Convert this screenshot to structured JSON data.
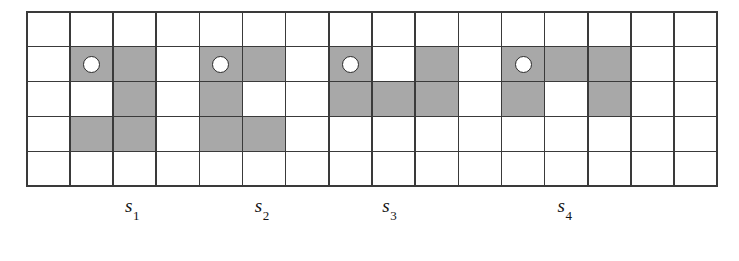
{
  "figure": {
    "grid": {
      "columns": 16,
      "rows": 5,
      "line_color": "#3a3a3a",
      "cell_fill_empty": "#ffffff",
      "cell_fill_shaded": "#a8a8a8",
      "marker_shape": "circle",
      "marker_fill": "#ffffff",
      "marker_stroke": "#2b2b2b"
    },
    "cells": [
      {
        "row": 1,
        "col": 1,
        "shaded": false,
        "marker": false
      },
      {
        "row": 1,
        "col": 2,
        "shaded": false,
        "marker": false
      },
      {
        "row": 1,
        "col": 3,
        "shaded": false,
        "marker": false
      },
      {
        "row": 1,
        "col": 4,
        "shaded": false,
        "marker": false
      },
      {
        "row": 1,
        "col": 5,
        "shaded": false,
        "marker": false
      },
      {
        "row": 1,
        "col": 6,
        "shaded": false,
        "marker": false
      },
      {
        "row": 1,
        "col": 7,
        "shaded": false,
        "marker": false
      },
      {
        "row": 1,
        "col": 8,
        "shaded": false,
        "marker": false
      },
      {
        "row": 1,
        "col": 9,
        "shaded": false,
        "marker": false
      },
      {
        "row": 1,
        "col": 10,
        "shaded": false,
        "marker": false
      },
      {
        "row": 1,
        "col": 11,
        "shaded": false,
        "marker": false
      },
      {
        "row": 1,
        "col": 12,
        "shaded": false,
        "marker": false
      },
      {
        "row": 1,
        "col": 13,
        "shaded": false,
        "marker": false
      },
      {
        "row": 1,
        "col": 14,
        "shaded": false,
        "marker": false
      },
      {
        "row": 1,
        "col": 15,
        "shaded": false,
        "marker": false
      },
      {
        "row": 1,
        "col": 16,
        "shaded": false,
        "marker": false
      },
      {
        "row": 2,
        "col": 1,
        "shaded": false,
        "marker": false
      },
      {
        "row": 2,
        "col": 2,
        "shaded": true,
        "marker": true
      },
      {
        "row": 2,
        "col": 3,
        "shaded": true,
        "marker": false
      },
      {
        "row": 2,
        "col": 4,
        "shaded": false,
        "marker": false
      },
      {
        "row": 2,
        "col": 5,
        "shaded": true,
        "marker": true
      },
      {
        "row": 2,
        "col": 6,
        "shaded": true,
        "marker": false
      },
      {
        "row": 2,
        "col": 7,
        "shaded": false,
        "marker": false
      },
      {
        "row": 2,
        "col": 8,
        "shaded": true,
        "marker": true
      },
      {
        "row": 2,
        "col": 9,
        "shaded": false,
        "marker": false
      },
      {
        "row": 2,
        "col": 10,
        "shaded": true,
        "marker": false
      },
      {
        "row": 2,
        "col": 11,
        "shaded": false,
        "marker": false
      },
      {
        "row": 2,
        "col": 12,
        "shaded": true,
        "marker": true
      },
      {
        "row": 2,
        "col": 13,
        "shaded": true,
        "marker": false
      },
      {
        "row": 2,
        "col": 14,
        "shaded": true,
        "marker": false
      },
      {
        "row": 2,
        "col": 15,
        "shaded": false,
        "marker": false
      },
      {
        "row": 2,
        "col": 16,
        "shaded": false,
        "marker": false
      },
      {
        "row": 3,
        "col": 1,
        "shaded": false,
        "marker": false
      },
      {
        "row": 3,
        "col": 2,
        "shaded": false,
        "marker": false
      },
      {
        "row": 3,
        "col": 3,
        "shaded": true,
        "marker": false
      },
      {
        "row": 3,
        "col": 4,
        "shaded": false,
        "marker": false
      },
      {
        "row": 3,
        "col": 5,
        "shaded": true,
        "marker": false
      },
      {
        "row": 3,
        "col": 6,
        "shaded": false,
        "marker": false
      },
      {
        "row": 3,
        "col": 7,
        "shaded": false,
        "marker": false
      },
      {
        "row": 3,
        "col": 8,
        "shaded": true,
        "marker": false
      },
      {
        "row": 3,
        "col": 9,
        "shaded": true,
        "marker": false
      },
      {
        "row": 3,
        "col": 10,
        "shaded": true,
        "marker": false
      },
      {
        "row": 3,
        "col": 11,
        "shaded": false,
        "marker": false
      },
      {
        "row": 3,
        "col": 12,
        "shaded": true,
        "marker": false
      },
      {
        "row": 3,
        "col": 13,
        "shaded": false,
        "marker": false
      },
      {
        "row": 3,
        "col": 14,
        "shaded": true,
        "marker": false
      },
      {
        "row": 3,
        "col": 15,
        "shaded": false,
        "marker": false
      },
      {
        "row": 3,
        "col": 16,
        "shaded": false,
        "marker": false
      },
      {
        "row": 4,
        "col": 1,
        "shaded": false,
        "marker": false
      },
      {
        "row": 4,
        "col": 2,
        "shaded": true,
        "marker": false
      },
      {
        "row": 4,
        "col": 3,
        "shaded": true,
        "marker": false
      },
      {
        "row": 4,
        "col": 4,
        "shaded": false,
        "marker": false
      },
      {
        "row": 4,
        "col": 5,
        "shaded": true,
        "marker": false
      },
      {
        "row": 4,
        "col": 6,
        "shaded": true,
        "marker": false
      },
      {
        "row": 4,
        "col": 7,
        "shaded": false,
        "marker": false
      },
      {
        "row": 4,
        "col": 8,
        "shaded": false,
        "marker": false
      },
      {
        "row": 4,
        "col": 9,
        "shaded": false,
        "marker": false
      },
      {
        "row": 4,
        "col": 10,
        "shaded": false,
        "marker": false
      },
      {
        "row": 4,
        "col": 11,
        "shaded": false,
        "marker": false
      },
      {
        "row": 4,
        "col": 12,
        "shaded": false,
        "marker": false
      },
      {
        "row": 4,
        "col": 13,
        "shaded": false,
        "marker": false
      },
      {
        "row": 4,
        "col": 14,
        "shaded": false,
        "marker": false
      },
      {
        "row": 4,
        "col": 15,
        "shaded": false,
        "marker": false
      },
      {
        "row": 4,
        "col": 16,
        "shaded": false,
        "marker": false
      },
      {
        "row": 5,
        "col": 1,
        "shaded": false,
        "marker": false
      },
      {
        "row": 5,
        "col": 2,
        "shaded": false,
        "marker": false
      },
      {
        "row": 5,
        "col": 3,
        "shaded": false,
        "marker": false
      },
      {
        "row": 5,
        "col": 4,
        "shaded": false,
        "marker": false
      },
      {
        "row": 5,
        "col": 5,
        "shaded": false,
        "marker": false
      },
      {
        "row": 5,
        "col": 6,
        "shaded": false,
        "marker": false
      },
      {
        "row": 5,
        "col": 7,
        "shaded": false,
        "marker": false
      },
      {
        "row": 5,
        "col": 8,
        "shaded": false,
        "marker": false
      },
      {
        "row": 5,
        "col": 9,
        "shaded": false,
        "marker": false
      },
      {
        "row": 5,
        "col": 10,
        "shaded": false,
        "marker": false
      },
      {
        "row": 5,
        "col": 11,
        "shaded": false,
        "marker": false
      },
      {
        "row": 5,
        "col": 12,
        "shaded": false,
        "marker": false
      },
      {
        "row": 5,
        "col": 13,
        "shaded": false,
        "marker": false
      },
      {
        "row": 5,
        "col": 14,
        "shaded": false,
        "marker": false
      },
      {
        "row": 5,
        "col": 15,
        "shaded": false,
        "marker": false
      },
      {
        "row": 5,
        "col": 16,
        "shaded": false,
        "marker": false
      }
    ],
    "labels": [
      {
        "base": "s",
        "sub": "1",
        "center_col": 2.45
      },
      {
        "base": "s",
        "sub": "2",
        "center_col": 5.45
      },
      {
        "base": "s",
        "sub": "3",
        "center_col": 8.4
      },
      {
        "base": "s",
        "sub": "4",
        "center_col": 12.45
      }
    ]
  }
}
